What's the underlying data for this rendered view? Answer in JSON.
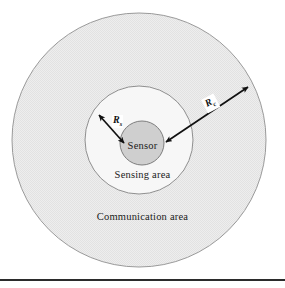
{
  "figure": {
    "background_color": "#ffffff",
    "rule_color": "#2b2b2b"
  },
  "labels": {
    "sensor": "Sensor",
    "sensing_area": "Sensing area",
    "communication_area": "Communication area",
    "radius_sensing": "R",
    "radius_sensing_sub": "s",
    "radius_communication": "R",
    "radius_communication_sub": "c"
  },
  "diagram_data": {
    "type": "concentric-circles",
    "center": {
      "x": 139,
      "y": 140
    },
    "regions": [
      {
        "name": "communication-area",
        "label": "Communication area",
        "radius": 127,
        "fill": "#ebebeb",
        "stroke": "#9a9a9a",
        "pattern": "dither"
      },
      {
        "name": "sensing-area",
        "label": "Sensing area",
        "radius": 54,
        "fill": "#f7f7f7",
        "stroke": "#8f8f8f",
        "pattern": "solid"
      },
      {
        "name": "sensor-node",
        "label": "Sensor",
        "radius": 22,
        "fill": "#cfcfcf",
        "stroke": "#7d7d7d",
        "pattern": "solid"
      }
    ],
    "arrows": [
      {
        "name": "sensing-radius-arrow",
        "label": "Rs",
        "double_headed": true,
        "from": {
          "x": 96,
          "y": 112
        },
        "to": {
          "x": 126,
          "y": 145
        }
      },
      {
        "name": "communication-radius-arrow",
        "label": "Rc",
        "double_headed": true,
        "from": {
          "x": 251,
          "y": 84
        },
        "to": {
          "x": 162,
          "y": 142
        }
      }
    ]
  }
}
